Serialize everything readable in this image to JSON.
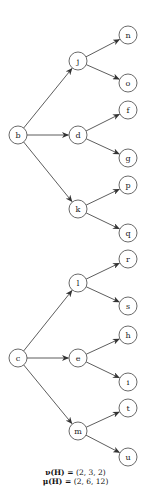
{
  "diagram": {
    "type": "directed-forest",
    "node_radius": 9,
    "nodes": [
      {
        "id": "b",
        "label": "b",
        "x": 18,
        "y": 135
      },
      {
        "id": "j",
        "label": "j",
        "x": 78,
        "y": 61
      },
      {
        "id": "d",
        "label": "d",
        "x": 78,
        "y": 135
      },
      {
        "id": "k",
        "label": "k",
        "x": 78,
        "y": 209
      },
      {
        "id": "n",
        "label": "n",
        "x": 128,
        "y": 35
      },
      {
        "id": "o",
        "label": "o",
        "x": 128,
        "y": 83
      },
      {
        "id": "f",
        "label": "f",
        "x": 128,
        "y": 110
      },
      {
        "id": "g",
        "label": "g",
        "x": 128,
        "y": 158
      },
      {
        "id": "p",
        "label": "p",
        "x": 128,
        "y": 185
      },
      {
        "id": "q",
        "label": "q",
        "x": 128,
        "y": 233
      },
      {
        "id": "c",
        "label": "c",
        "x": 18,
        "y": 358
      },
      {
        "id": "l",
        "label": "l",
        "x": 78,
        "y": 283
      },
      {
        "id": "e",
        "label": "e",
        "x": 78,
        "y": 358
      },
      {
        "id": "m",
        "label": "m",
        "x": 78,
        "y": 431
      },
      {
        "id": "r",
        "label": "r",
        "x": 128,
        "y": 259
      },
      {
        "id": "s",
        "label": "s",
        "x": 128,
        "y": 306
      },
      {
        "id": "h",
        "label": "h",
        "x": 128,
        "y": 335
      },
      {
        "id": "i",
        "label": "i",
        "x": 128,
        "y": 382
      },
      {
        "id": "t",
        "label": "t",
        "x": 128,
        "y": 408
      },
      {
        "id": "u",
        "label": "u",
        "x": 128,
        "y": 457
      }
    ],
    "edges": [
      [
        "b",
        "j"
      ],
      [
        "b",
        "d"
      ],
      [
        "b",
        "k"
      ],
      [
        "j",
        "n"
      ],
      [
        "j",
        "o"
      ],
      [
        "d",
        "f"
      ],
      [
        "d",
        "g"
      ],
      [
        "k",
        "p"
      ],
      [
        "k",
        "q"
      ],
      [
        "c",
        "l"
      ],
      [
        "c",
        "e"
      ],
      [
        "c",
        "m"
      ],
      [
        "l",
        "r"
      ],
      [
        "l",
        "s"
      ],
      [
        "e",
        "h"
      ],
      [
        "e",
        "i"
      ],
      [
        "m",
        "t"
      ],
      [
        "m",
        "u"
      ]
    ],
    "colors": {
      "stroke": "#444444",
      "edge": "#333333",
      "text": "#222222",
      "background": "#ffffff"
    }
  },
  "caption": {
    "nu_lhs": "ν(H) = ",
    "nu_value": "(2, 3, 2)",
    "mu_lhs": "μ(H) = ",
    "mu_value": "(2, 6, 12)"
  }
}
